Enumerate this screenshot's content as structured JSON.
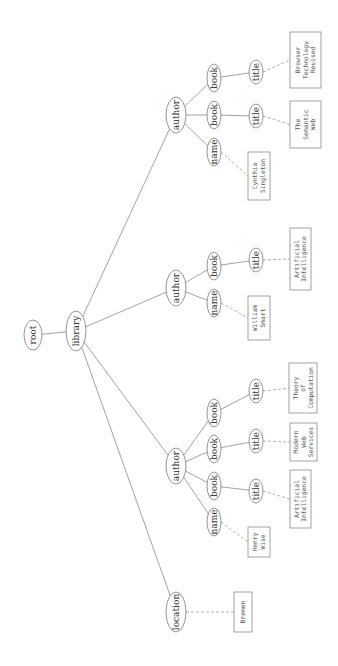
{
  "diagram": {
    "type": "tree",
    "orientation": "rotated-90-ccw",
    "nodes": [
      {
        "id": "root",
        "label": "root",
        "cx": 33,
        "cy": 335,
        "rx": 9,
        "ry": 15
      },
      {
        "id": "library",
        "label": "library",
        "cx": 76,
        "cy": 331,
        "rx": 10,
        "ry": 20
      },
      {
        "id": "author1",
        "label": "author",
        "cx": 176,
        "cy": 115,
        "rx": 10,
        "ry": 18
      },
      {
        "id": "author2",
        "label": "author",
        "cx": 176,
        "cy": 288,
        "rx": 10,
        "ry": 18
      },
      {
        "id": "author3",
        "label": "author",
        "cx": 176,
        "cy": 466,
        "rx": 10,
        "ry": 18
      },
      {
        "id": "location",
        "label": "location",
        "cx": 176,
        "cy": 612,
        "rx": 10,
        "ry": 20
      },
      {
        "id": "a1_book2",
        "label": "book",
        "cx": 214,
        "cy": 78,
        "rx": 7,
        "ry": 14
      },
      {
        "id": "a1_book1",
        "label": "book",
        "cx": 214,
        "cy": 115,
        "rx": 7,
        "ry": 14
      },
      {
        "id": "a1_name",
        "label": "name",
        "cx": 214,
        "cy": 152,
        "rx": 7,
        "ry": 14
      },
      {
        "id": "a1_title2",
        "label": "title",
        "cx": 256,
        "cy": 72,
        "rx": 7,
        "ry": 12
      },
      {
        "id": "a1_title1",
        "label": "title",
        "cx": 256,
        "cy": 116,
        "rx": 7,
        "ry": 12
      },
      {
        "id": "a2_book",
        "label": "book",
        "cx": 214,
        "cy": 266,
        "rx": 7,
        "ry": 14
      },
      {
        "id": "a2_name",
        "label": "name",
        "cx": 214,
        "cy": 303,
        "rx": 7,
        "ry": 14
      },
      {
        "id": "a2_title",
        "label": "title",
        "cx": 256,
        "cy": 260,
        "rx": 7,
        "ry": 12
      },
      {
        "id": "a3_book3",
        "label": "book",
        "cx": 214,
        "cy": 413,
        "rx": 7,
        "ry": 14
      },
      {
        "id": "a3_book2",
        "label": "book",
        "cx": 214,
        "cy": 449,
        "rx": 7,
        "ry": 14
      },
      {
        "id": "a3_book1",
        "label": "book",
        "cx": 214,
        "cy": 486,
        "rx": 7,
        "ry": 14
      },
      {
        "id": "a3_name",
        "label": "name",
        "cx": 214,
        "cy": 522,
        "rx": 7,
        "ry": 14
      },
      {
        "id": "a3_title3",
        "label": "title",
        "cx": 256,
        "cy": 391,
        "rx": 7,
        "ry": 12
      },
      {
        "id": "a3_title2",
        "label": "title",
        "cx": 256,
        "cy": 441,
        "rx": 7,
        "ry": 12
      },
      {
        "id": "a3_title1",
        "label": "title",
        "cx": 256,
        "cy": 491,
        "rx": 7,
        "ry": 12
      }
    ],
    "edges": [
      [
        "root",
        "library"
      ],
      [
        "library",
        "author1"
      ],
      [
        "library",
        "author2"
      ],
      [
        "library",
        "author3"
      ],
      [
        "library",
        "location"
      ],
      [
        "author1",
        "a1_book2"
      ],
      [
        "author1",
        "a1_book1"
      ],
      [
        "author1",
        "a1_name"
      ],
      [
        "a1_book2",
        "a1_title2"
      ],
      [
        "a1_book1",
        "a1_title1"
      ],
      [
        "author2",
        "a2_book"
      ],
      [
        "author2",
        "a2_name"
      ],
      [
        "a2_book",
        "a2_title"
      ],
      [
        "author3",
        "a3_book3"
      ],
      [
        "author3",
        "a3_book2"
      ],
      [
        "author3",
        "a3_book1"
      ],
      [
        "author3",
        "a3_name"
      ],
      [
        "a3_book3",
        "a3_title3"
      ],
      [
        "a3_book2",
        "a3_title2"
      ],
      [
        "a3_book1",
        "a3_title1"
      ]
    ],
    "leaves": [
      {
        "id": "leaf_browser",
        "parent": "a1_title2",
        "lines": [
          "Browser",
          "Technology",
          "Revised"
        ],
        "x": 290,
        "y": 32,
        "w": 31,
        "h": 56
      },
      {
        "id": "leaf_semweb",
        "parent": "a1_title1",
        "lines": [
          "The",
          "Semantic",
          "Web"
        ],
        "x": 290,
        "y": 101,
        "w": 31,
        "h": 47
      },
      {
        "id": "leaf_cynthia",
        "parent": "a1_name",
        "lines": [
          "Cynthia",
          "Singleton"
        ],
        "x": 248,
        "y": 152,
        "w": 22,
        "h": 48
      },
      {
        "id": "leaf_ai2",
        "parent": "a2_title",
        "lines": [
          "Artificial",
          "Intelligence"
        ],
        "x": 290,
        "y": 228,
        "w": 21,
        "h": 62
      },
      {
        "id": "leaf_william",
        "parent": "a2_name",
        "lines": [
          "William",
          "Smart"
        ],
        "x": 248,
        "y": 296,
        "w": 22,
        "h": 44
      },
      {
        "id": "leaf_theory",
        "parent": "a3_title3",
        "lines": [
          "Theory",
          "of",
          "Computation"
        ],
        "x": 289,
        "y": 363,
        "w": 28,
        "h": 50
      },
      {
        "id": "leaf_modern",
        "parent": "a3_title2",
        "lines": [
          "Modern",
          "Web",
          "Services"
        ],
        "x": 290,
        "y": 423,
        "w": 27,
        "h": 38
      },
      {
        "id": "leaf_ai3",
        "parent": "a3_title1",
        "lines": [
          "Artificial",
          "Intelligence"
        ],
        "x": 290,
        "y": 470,
        "w": 21,
        "h": 58
      },
      {
        "id": "leaf_henry",
        "parent": "a3_name",
        "lines": [
          "Henry",
          "Wise"
        ],
        "x": 248,
        "y": 527,
        "w": 22,
        "h": 30
      },
      {
        "id": "leaf_bremen",
        "parent": "location",
        "lines": [
          "Bremen"
        ],
        "x": 234,
        "y": 592,
        "w": 18,
        "h": 40
      }
    ]
  }
}
